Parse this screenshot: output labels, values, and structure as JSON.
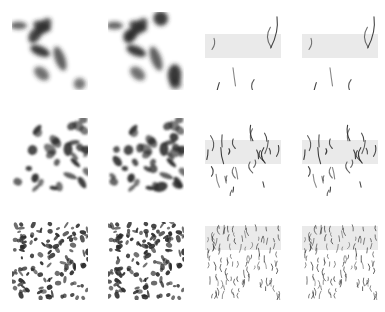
{
  "figure": {
    "layout": {
      "rows": 3,
      "cols": 4
    },
    "colors": {
      "background": "#ffffff",
      "ink": "#2b2b2b",
      "haze": "#d8d8d8"
    },
    "panels": [
      {
        "row": 0,
        "col": 0,
        "x": 12,
        "y": 12,
        "kind": "blobs",
        "scale": "large",
        "density": 0.35
      },
      {
        "row": 0,
        "col": 1,
        "x": 108,
        "y": 12,
        "kind": "blobs",
        "scale": "large",
        "density": 0.5
      },
      {
        "row": 0,
        "col": 2,
        "x": 205,
        "y": 12,
        "kind": "strands",
        "scale": "large",
        "density": 0.3
      },
      {
        "row": 0,
        "col": 3,
        "x": 302,
        "y": 12,
        "kind": "strands",
        "scale": "large",
        "density": 0.3
      },
      {
        "row": 1,
        "col": 0,
        "x": 12,
        "y": 118,
        "kind": "blobs",
        "scale": "medium",
        "density": 0.4
      },
      {
        "row": 1,
        "col": 1,
        "x": 108,
        "y": 118,
        "kind": "blobs",
        "scale": "medium",
        "density": 0.55
      },
      {
        "row": 1,
        "col": 2,
        "x": 205,
        "y": 118,
        "kind": "strands",
        "scale": "medium",
        "density": 0.55
      },
      {
        "row": 1,
        "col": 3,
        "x": 302,
        "y": 118,
        "kind": "strands",
        "scale": "medium",
        "density": 0.55
      },
      {
        "row": 2,
        "col": 0,
        "x": 12,
        "y": 222,
        "kind": "blobs",
        "scale": "small",
        "density": 0.45
      },
      {
        "row": 2,
        "col": 1,
        "x": 108,
        "y": 222,
        "kind": "blobs",
        "scale": "small",
        "density": 0.55
      },
      {
        "row": 2,
        "col": 2,
        "x": 205,
        "y": 222,
        "kind": "strands",
        "scale": "small",
        "density": 0.8
      },
      {
        "row": 2,
        "col": 3,
        "x": 302,
        "y": 222,
        "kind": "strands",
        "scale": "small",
        "density": 0.8
      }
    ]
  }
}
